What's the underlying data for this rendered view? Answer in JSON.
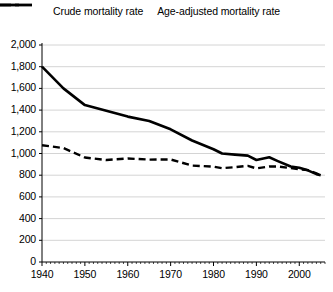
{
  "chart_data": {
    "type": "line",
    "title": "",
    "xlabel": "",
    "ylabel": "",
    "xlim": [
      1940,
      2006
    ],
    "ylim": [
      0,
      2000
    ],
    "grid": true,
    "legend_position": "top",
    "ytick_labels": [
      "2,000",
      "1,800",
      "1,600",
      "1,400",
      "1,200",
      "1,000",
      "800",
      "600",
      "400",
      "200",
      "0"
    ],
    "ytick_values": [
      2000,
      1800,
      1600,
      1400,
      1200,
      1000,
      800,
      600,
      400,
      200,
      0
    ],
    "xtick_labels": [
      "1940",
      "1950",
      "1960",
      "1970",
      "1980",
      "1990",
      "2000"
    ],
    "xtick_values": [
      1940,
      1950,
      1960,
      1970,
      1980,
      1990,
      2000
    ],
    "minor_xticks": "annual",
    "series": [
      {
        "name": "Crude mortality rate",
        "style": "dashed",
        "color": "#000000",
        "x": [
          1940,
          1945,
          1950,
          1955,
          1960,
          1965,
          1970,
          1975,
          1980,
          1982,
          1985,
          1988,
          1990,
          1993,
          1995,
          1998,
          2000,
          2002,
          2004,
          2005
        ],
        "values": [
          1076,
          1050,
          963,
          940,
          954,
          944,
          945,
          889,
          879,
          865,
          874,
          886,
          863,
          880,
          880,
          865,
          854,
          847,
          816,
          800
        ]
      },
      {
        "name": "Age-adjusted mortality rate",
        "style": "solid",
        "color": "#000000",
        "x": [
          1940,
          1945,
          1950,
          1955,
          1960,
          1965,
          1970,
          1975,
          1980,
          1982,
          1985,
          1988,
          1990,
          1993,
          1995,
          1998,
          2000,
          2002,
          2004,
          2005
        ],
        "values": [
          1800,
          1600,
          1446,
          1395,
          1340,
          1300,
          1223,
          1120,
          1039,
          1000,
          990,
          980,
          940,
          965,
          930,
          880,
          869,
          845,
          810,
          800
        ]
      }
    ]
  },
  "legend": {
    "items": [
      {
        "label": "Crude mortality rate",
        "marker": "dashed-line-marker"
      },
      {
        "label": "Age-adjusted mortality rate",
        "marker": "solid-line-marker"
      }
    ]
  }
}
